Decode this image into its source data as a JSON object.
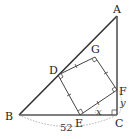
{
  "figure": {
    "type": "geometry-diagram",
    "points": {
      "A": {
        "label": "A"
      },
      "B": {
        "label": "B"
      },
      "C": {
        "label": "C"
      },
      "D": {
        "label": "D"
      },
      "E": {
        "label": "E"
      },
      "F": {
        "label": "F"
      },
      "G": {
        "label": "G"
      }
    },
    "measurements": {
      "BC": "52",
      "angle_FEC": "x",
      "FC": "y"
    },
    "colors": {
      "triangle_stroke": "#333333",
      "square_stroke": "#444444",
      "dotted_arc": "#999999"
    }
  }
}
